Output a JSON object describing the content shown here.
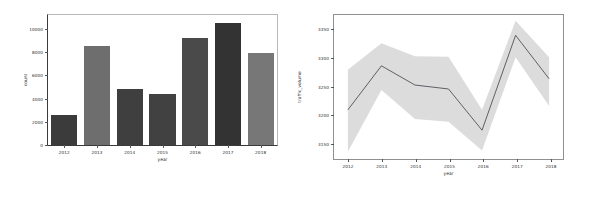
{
  "figure": {
    "background": "#ffffff",
    "width": 589,
    "height": 198
  },
  "chart_data": [
    {
      "id": "bar-panel",
      "type": "bar",
      "title": "",
      "xlabel": "year",
      "ylabel": "count",
      "categories": [
        "2012",
        "2013",
        "2014",
        "2015",
        "2016",
        "2017",
        "2018"
      ],
      "values": [
        2550,
        8550,
        4800,
        4400,
        9250,
        10550,
        7950
      ],
      "bar_colors": [
        "#3b3b3b",
        "#6e6e6e",
        "#3f3f3f",
        "#414141",
        "#4a4a4a",
        "#333333",
        "#777777"
      ],
      "ylim": [
        0,
        11200
      ],
      "yticks": [
        0,
        2000,
        4000,
        6000,
        8000,
        10000
      ],
      "ytick_labels": [
        "0",
        "2000",
        "4000",
        "6000",
        "8000",
        "10000"
      ],
      "grid": false,
      "legend": "none"
    },
    {
      "id": "line-panel",
      "type": "line",
      "title": "",
      "xlabel": "year",
      "ylabel": "traffic_volume",
      "x": [
        "2012",
        "2013",
        "2014",
        "2015",
        "2016",
        "2017",
        "2018"
      ],
      "values": [
        3207,
        3285,
        3251,
        3244,
        3171,
        3339,
        3262
      ],
      "ci_lower": [
        3133,
        3242,
        3191,
        3186,
        3135,
        3300,
        3214
      ],
      "ci_upper": [
        3278,
        3325,
        3302,
        3301,
        3207,
        3365,
        3300
      ],
      "line_color": "#4c5157",
      "band_color": "#dcdcdc",
      "ylim": [
        3120,
        3375
      ],
      "yticks": [
        3150,
        3200,
        3250,
        3300,
        3350
      ],
      "ytick_labels": [
        "3150",
        "3200",
        "3250",
        "3300",
        "3350"
      ],
      "grid": false,
      "legend": "none"
    }
  ]
}
